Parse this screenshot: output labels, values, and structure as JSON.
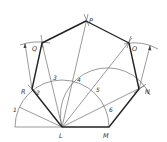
{
  "figure": {
    "type": "geometric-construction",
    "vertices": {
      "L": {
        "label": "L",
        "x": 62,
        "y": 127
      },
      "M": {
        "label": "M",
        "x": 109,
        "y": 127
      },
      "N": {
        "label": "N",
        "x": 139,
        "y": 89
      },
      "O": {
        "label": "O",
        "x": 129,
        "y": 43
      },
      "P": {
        "label": "P",
        "x": 86,
        "y": 21
      },
      "Q": {
        "label": "Q",
        "x": 42,
        "y": 43
      },
      "R": {
        "label": "R",
        "x": 32,
        "y": 89
      }
    },
    "division_labels": [
      "1",
      "2",
      "3",
      "4",
      "5",
      "6"
    ],
    "labels": {
      "L": "L",
      "M": "M",
      "N": "N",
      "O": "O",
      "P": "P",
      "Q": "Q",
      "R": "R",
      "d1": "1",
      "d2": "2",
      "d3": "3",
      "d4": "4",
      "d5": "5",
      "d6": "6"
    }
  }
}
